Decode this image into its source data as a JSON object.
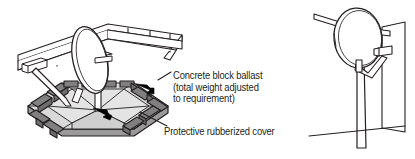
{
  "figure": {
    "background_color": "#ffffff",
    "line_color": "#231f20",
    "text_color": "#231f20"
  },
  "callouts": [
    {
      "id": "concrete-block-ballast",
      "lines": [
        "Concrete block ballast",
        "(total weight adjusted",
        " to requirement)"
      ],
      "line1": "Concrete block ballast",
      "line2": "(total weight adjusted",
      "line3": " to requirement)"
    },
    {
      "id": "protective-rubberized-cover",
      "lines": [
        "Protective rubberized cover"
      ],
      "line1": "Protective rubberized cover"
    }
  ],
  "panels": {
    "left": {
      "name": "ballast-roof-mount-illustration",
      "parts": {
        "dish": "satellite-dish",
        "mast": "vertical-mast-pole",
        "platform": "hexagonal-ballast-platform",
        "blocks": "concrete-ballast-blocks",
        "cover": "protective-rubberized-cover",
        "parapet": "roof-parapet-wall",
        "guy": "support-strut"
      }
    },
    "right": {
      "name": "pole-wall-mount-illustration",
      "parts": {
        "dish": "satellite-dish",
        "pole": "vertical-mounting-pole",
        "arm": "feed-arm-with-lnb",
        "wall": "wall-panel",
        "rail": "horizontal-rail",
        "ground": "ground-line"
      }
    }
  },
  "colors": {
    "stroke": "#231f20",
    "block_fill": "#808080",
    "block_fill_dark": "#6e6e6e",
    "platform_fill": "#d9d9d9",
    "platform_fill_light": "#e8e8e8",
    "platform_fill_mid": "#c9c9c9",
    "dish_fill": "#ffffff",
    "arrow_fill": "#000000"
  }
}
